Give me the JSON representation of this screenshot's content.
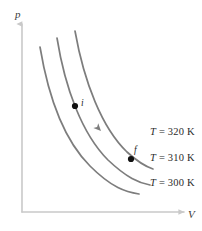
{
  "figure": {
    "background_color": "#ffffff",
    "width": 202,
    "height": 231
  },
  "axes": {
    "color": "#c9c9c9",
    "vertical": {
      "label": "p",
      "name": "pressure-axis",
      "x": 22,
      "y_top": 22,
      "y_bottom": 212
    },
    "horizontal": {
      "label": "V",
      "name": "volume-axis",
      "y": 212,
      "x_left": 22,
      "x_right": 186
    }
  },
  "curves": {
    "color": "#7d7d7d",
    "stroke_width": 1.7,
    "items": [
      {
        "name": "isotherm-300k",
        "label": "T = 300 K",
        "temperature": 300,
        "unit": "K",
        "path": "M 40,47 C 48,95 64,140 90,166 C 112,188 126,192 139,194"
      },
      {
        "name": "isotherm-310k",
        "label": "T = 310 K",
        "temperature": 310,
        "unit": "K",
        "path": "M 57,38 C 65,88 82,134 108,160 C 127,178 139,183 150,185"
      },
      {
        "name": "isotherm-320k",
        "label": "T = 320 K",
        "temperature": 320,
        "unit": "K",
        "path": "M 75,31 C 84,82 102,128 127,152 C 139,163 147,167 153,169"
      }
    ]
  },
  "labels": {
    "isotherm_320": {
      "t": "T",
      "eq": "= 320 K",
      "full": "T = 320 K",
      "x": 150,
      "y": 126
    },
    "isotherm_310": {
      "t": "T",
      "eq": "= 310 K",
      "full": "T = 310 K",
      "x": 150,
      "y": 152
    },
    "isotherm_300": {
      "t": "T",
      "eq": "= 300 K",
      "full": "T = 300 K",
      "x": 150,
      "y": 177
    }
  },
  "points": [
    {
      "name": "point-i",
      "label": "i",
      "description": "initial state",
      "x": 75,
      "y": 106,
      "label_x": 81,
      "label_y": 98,
      "color": "#111111",
      "radius": 3.1
    },
    {
      "name": "point-f",
      "label": "f",
      "description": "final state",
      "x": 131,
      "y": 159,
      "label_x": 134,
      "label_y": 145,
      "color": "#111111",
      "radius": 3.1
    }
  ],
  "process_arrow": {
    "name": "process-direction-arrow",
    "description": "arrowhead indicating process direction from i to f along the 310 K isotherm",
    "x": 101,
    "y": 131,
    "angle_deg": 46,
    "color": "#7d7d7d"
  }
}
